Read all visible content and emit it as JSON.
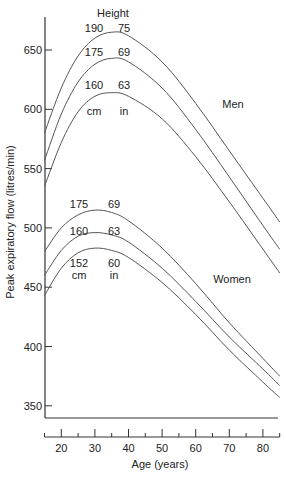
{
  "chart_data": {
    "type": "line",
    "title": "",
    "xlabel": "Age (years)",
    "ylabel": "Peak expiratory flow (litres/min)",
    "xlim": [
      15,
      85
    ],
    "ylim": [
      340,
      680
    ],
    "x_ticks_major": [
      20,
      30,
      40,
      50,
      60,
      70,
      80
    ],
    "x_ticks_minor": [
      15,
      25,
      35,
      45,
      55,
      65,
      75,
      85
    ],
    "y_ticks": [
      350,
      400,
      450,
      500,
      550,
      600,
      650
    ],
    "grid": false,
    "height_header": "Height",
    "group_labels": {
      "men": "Men",
      "women": "Women"
    },
    "unit_labels": {
      "cm": "cm",
      "in": "in"
    },
    "series": [
      {
        "name": "Men 190 cm / 75 in",
        "group": "Men",
        "cm": "190",
        "in": "75",
        "x": [
          15,
          20,
          25,
          30,
          35,
          40,
          50,
          60,
          70,
          80,
          85
        ],
        "values": [
          580,
          618,
          645,
          660,
          665,
          662,
          640,
          605,
          565,
          525,
          505
        ]
      },
      {
        "name": "Men 175 cm / 69 in",
        "group": "Men",
        "cm": "175",
        "in": "69",
        "x": [
          15,
          20,
          25,
          30,
          35,
          40,
          50,
          60,
          70,
          80,
          85
        ],
        "values": [
          557,
          596,
          623,
          638,
          643,
          640,
          618,
          583,
          543,
          502,
          482
        ]
      },
      {
        "name": "Men 160 cm / 63 in",
        "group": "Men",
        "cm": "160",
        "in": "63",
        "x": [
          15,
          20,
          25,
          30,
          35,
          40,
          50,
          60,
          70,
          80,
          85
        ],
        "values": [
          535,
          572,
          598,
          611,
          614,
          611,
          592,
          560,
          522,
          482,
          462
        ]
      },
      {
        "name": "Women 175 cm / 69 in",
        "group": "Women",
        "cm": "175",
        "in": "69",
        "x": [
          15,
          20,
          25,
          30,
          35,
          40,
          50,
          60,
          70,
          80,
          85
        ],
        "values": [
          480,
          500,
          511,
          515,
          513,
          506,
          483,
          453,
          420,
          390,
          375
        ]
      },
      {
        "name": "Women 160 cm / 63 in",
        "group": "Women",
        "cm": "160",
        "in": "63",
        "x": [
          15,
          20,
          25,
          30,
          35,
          40,
          50,
          60,
          70,
          80,
          85
        ],
        "values": [
          460,
          481,
          493,
          496,
          494,
          488,
          466,
          438,
          408,
          381,
          367
        ]
      },
      {
        "name": "Women 152 cm / 60 in",
        "group": "Women",
        "cm": "152",
        "in": "60",
        "x": [
          15,
          20,
          25,
          30,
          35,
          40,
          50,
          60,
          70,
          80,
          85
        ],
        "values": [
          443,
          466,
          479,
          483,
          481,
          475,
          454,
          427,
          397,
          370,
          357
        ]
      }
    ]
  },
  "colors": {
    "line": "#555555",
    "axis": "#333333",
    "text": "#222222",
    "background": "#ffffff"
  }
}
